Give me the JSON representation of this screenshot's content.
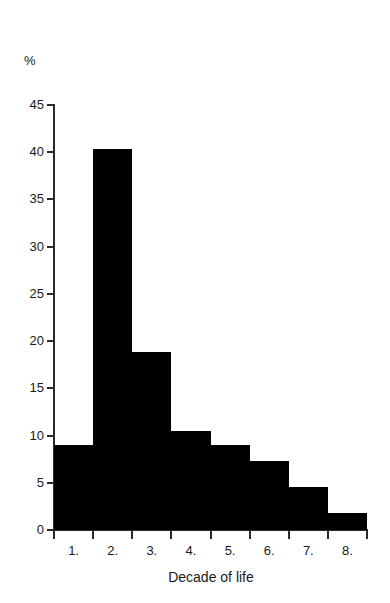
{
  "chart_data": {
    "type": "bar",
    "title": "",
    "subtitle": "",
    "xlabel": "Decade of life",
    "ylabel": "%",
    "categories": [
      "1.",
      "2.",
      "3.",
      "4.",
      "5.",
      "6.",
      "7.",
      "8."
    ],
    "values": [
      9.0,
      40.3,
      18.8,
      10.5,
      9.0,
      7.3,
      4.6,
      1.8
    ],
    "series": [
      {
        "name": "Percentage of cases",
        "values": [
          9.0,
          40.3,
          18.8,
          10.5,
          9.0,
          7.3,
          4.6,
          1.8
        ]
      }
    ],
    "ylim": [
      0,
      45
    ],
    "xlim": [
      0.5,
      8.5
    ],
    "y_ticks": [
      0,
      5,
      10,
      15,
      20,
      25,
      30,
      35,
      40,
      45
    ],
    "y_tick_labels": [
      "0",
      "5",
      "10",
      "15",
      "20",
      "25",
      "30",
      "35",
      "40",
      "45"
    ],
    "grid": false,
    "legend": false,
    "legend_position": "none",
    "bar_color": "#000000",
    "axis_color": "#2b2b2b",
    "background_color": "#ffffff",
    "bar_gap": 0,
    "annotations": []
  },
  "axis": {
    "y_unit_label": "%",
    "x_title": "Decade of life"
  }
}
